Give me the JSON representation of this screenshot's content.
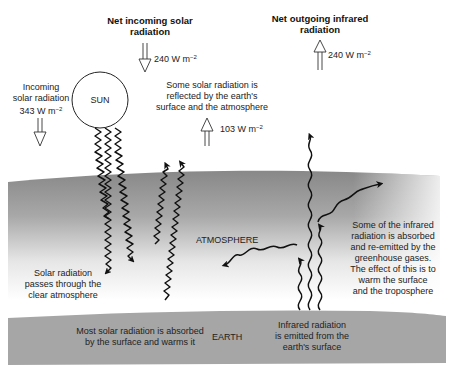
{
  "diagram": {
    "colors": {
      "atmosphere_top": "#8a8a8a",
      "atmosphere_bottom": "#ffffff",
      "earth": "#a4a4a4",
      "ink": "#1a1a1a",
      "background": "#ffffff"
    },
    "top_labels": {
      "net_incoming": {
        "line1": "Net incoming solar",
        "line2": "radiation",
        "value": "240 W m",
        "exp": "−2"
      },
      "net_outgoing": {
        "line1": "Net outgoing infrared",
        "line2": "radiation",
        "value": "240 W m",
        "exp": "−2"
      }
    },
    "incoming_solar": {
      "line1": "Incoming",
      "line2": "solar radiation",
      "line3": "343 W m",
      "exp": "−2"
    },
    "sun": {
      "label": "SUN"
    },
    "reflected": {
      "line1": "Some solar radiation is",
      "line2": "reflected by the earth's",
      "line3": "surface and the atmosphere",
      "value": "103 W m",
      "exp": "−2"
    },
    "atmosphere": {
      "label": "ATMOSPHERE"
    },
    "clear_atmosphere": {
      "line1": "Solar radiation",
      "line2": "passes through the",
      "line3": "clear atmosphere"
    },
    "greenhouse": {
      "line1": "Some of the infrared",
      "line2": "radiation is absorbed",
      "line3": "and re-emitted by the",
      "line4": "greenhouse gases.",
      "line5": "The effect of this is to",
      "line6": "warm the surface",
      "line7": "and the troposphere"
    },
    "earth": {
      "label": "EARTH",
      "absorbed": {
        "line1": "Most solar radiation is absorbed",
        "line2": "by the surface and warms it"
      },
      "emitted": {
        "line1": "Infrared radiation",
        "line2": "is emitted from the",
        "line3": "earth's surface"
      }
    },
    "icons": {
      "down_arrow": "hollow-down-arrow",
      "up_arrow": "hollow-up-arrow",
      "solar_wave": "zigzag-solar-ray",
      "infrared_wave": "smooth-infrared-wave"
    }
  }
}
